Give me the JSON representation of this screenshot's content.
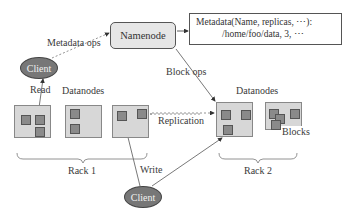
{
  "diagram": {
    "namenode": {
      "label": "Namenode"
    },
    "metadata": {
      "line1": "Metadata(Name, replicas, ⋯):",
      "line2": "/home/foo/data, 3, ⋯"
    },
    "clients": [
      {
        "label": "Client",
        "role": "read-client"
      },
      {
        "label": "Client",
        "role": "write-client"
      }
    ],
    "edges": {
      "metadata_ops": "Metadata ops",
      "block_ops": "Block ops",
      "read": "Read",
      "write": "Write",
      "replication": "Replication"
    },
    "racks": [
      {
        "label": "Rack 1",
        "datanodes_label": "Datanodes",
        "datanode_count": 3
      },
      {
        "label": "Rack 2",
        "datanodes_label": "Datanodes",
        "datanode_count": 2
      }
    ],
    "blocks_label": "Blocks",
    "colors": {
      "datanode_fill": "#d7d7d7",
      "block_fill": "#8a8a8a",
      "client_fill": "#777777",
      "namenode_fill": "#e6e6e6"
    }
  }
}
